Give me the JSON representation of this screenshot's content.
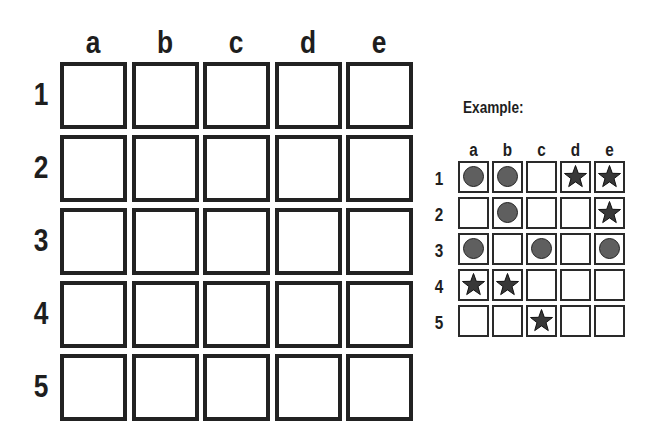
{
  "main_grid": {
    "columns": [
      "a",
      "b",
      "c",
      "d",
      "e"
    ],
    "rows": [
      "1",
      "2",
      "3",
      "4",
      "5"
    ],
    "cells": [
      [
        "",
        "",
        "",
        "",
        ""
      ],
      [
        "",
        "",
        "",
        "",
        ""
      ],
      [
        "",
        "",
        "",
        "",
        ""
      ],
      [
        "",
        "",
        "",
        "",
        ""
      ],
      [
        "",
        "",
        "",
        "",
        ""
      ]
    ]
  },
  "example": {
    "title": "Example:",
    "columns": [
      "a",
      "b",
      "c",
      "d",
      "e"
    ],
    "rows": [
      "1",
      "2",
      "3",
      "4",
      "5"
    ],
    "cells": [
      [
        "circle",
        "circle",
        "",
        "star",
        "star"
      ],
      [
        "",
        "circle",
        "",
        "",
        "star"
      ],
      [
        "circle",
        "",
        "circle",
        "",
        "circle"
      ],
      [
        "star",
        "star",
        "",
        "",
        ""
      ],
      [
        "",
        "",
        "star",
        "",
        ""
      ]
    ]
  },
  "colors": {
    "border": "#222222",
    "circle_fill": "#5f5f5f",
    "star_fill": "#383838"
  }
}
